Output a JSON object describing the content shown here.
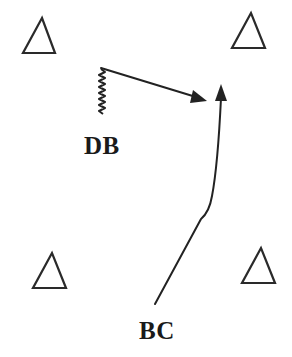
{
  "diagram": {
    "type": "drill-diagram",
    "labels": {
      "db": "DB",
      "bc": "BC"
    },
    "cones": [
      {
        "id": "top-left",
        "shape": "triangle"
      },
      {
        "id": "top-right",
        "shape": "triangle"
      },
      {
        "id": "bottom-left",
        "shape": "triangle"
      },
      {
        "id": "bottom-right",
        "shape": "triangle"
      }
    ],
    "movements": [
      {
        "player": "DB",
        "path": "backpedal (zigzag) then sprint diagonally right",
        "arrow": "straight"
      },
      {
        "player": "BC",
        "path": "run diagonally up-right then curve upward",
        "arrow": "curved"
      }
    ],
    "colors": {
      "ink": "#222222",
      "background": "#ffffff"
    }
  }
}
